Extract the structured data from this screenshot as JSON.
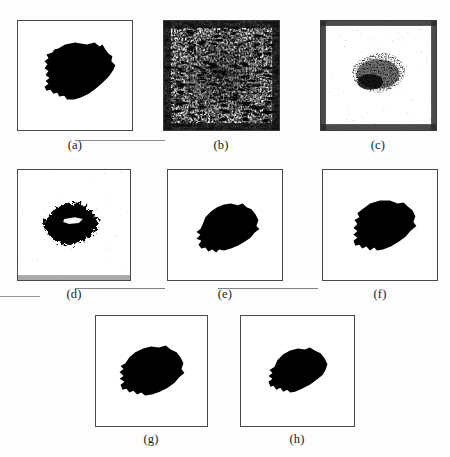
{
  "figure": {
    "page_background": "#fcfcfc",
    "panel_border_color": "#4a4a4a",
    "panel_fill_color": "#ffffff",
    "blob_color": "#000000",
    "panels": [
      {
        "id": "a",
        "caption": "(a)",
        "kind": "binary-silhouette",
        "description": "clean solid black irregular blob on white background",
        "x": 17,
        "y": 20,
        "w": 116,
        "h": 111,
        "caption_x": 55,
        "caption_y": 138,
        "caption_w": 40
      },
      {
        "id": "b",
        "caption": "(b)",
        "kind": "dense-noise",
        "description": "heavily speckled black and white noise texture filling the frame",
        "x": 163,
        "y": 20,
        "w": 117,
        "h": 111,
        "caption_x": 201,
        "caption_y": 138,
        "caption_w": 40
      },
      {
        "id": "c",
        "caption": "(c)",
        "kind": "sparse-noise-blob",
        "description": "dark noisy blob centered on a mostly white field with scattered speckles",
        "x": 320,
        "y": 20,
        "w": 117,
        "h": 111,
        "caption_x": 358,
        "caption_y": 138,
        "caption_w": 40
      },
      {
        "id": "d",
        "caption": "(d)",
        "kind": "rough-blob",
        "description": "black blob with ragged noisy border and small white holes inside",
        "x": 17,
        "y": 169,
        "w": 114,
        "h": 112,
        "caption_x": 54,
        "caption_y": 287,
        "caption_w": 40
      },
      {
        "id": "e",
        "caption": "(e)",
        "kind": "binary-silhouette",
        "description": "smooth solid black blob on white background",
        "x": 167,
        "y": 169,
        "w": 116,
        "h": 112,
        "caption_x": 205,
        "caption_y": 287,
        "caption_w": 40
      },
      {
        "id": "f",
        "caption": "(f)",
        "kind": "binary-silhouette",
        "description": "smooth solid black blob on white background",
        "x": 322,
        "y": 169,
        "w": 116,
        "h": 112,
        "caption_x": 360,
        "caption_y": 287,
        "caption_w": 40
      },
      {
        "id": "g",
        "caption": "(g)",
        "kind": "binary-silhouette",
        "description": "smooth solid black blob on white background",
        "x": 95,
        "y": 315,
        "w": 113,
        "h": 112,
        "caption_x": 131,
        "caption_y": 432,
        "caption_w": 40
      },
      {
        "id": "h",
        "caption": "(h)",
        "kind": "binary-silhouette",
        "description": "smooth solid black blob on white background",
        "x": 240,
        "y": 315,
        "w": 115,
        "h": 112,
        "caption_x": 277,
        "caption_y": 432,
        "caption_w": 40
      }
    ],
    "artifacts": [
      {
        "x": 75,
        "y": 140,
        "w": 90,
        "h": 1
      },
      {
        "x": 75,
        "y": 288,
        "w": 90,
        "h": 1
      },
      {
        "x": 218,
        "y": 288,
        "w": 100,
        "h": 1
      },
      {
        "x": 0,
        "y": 296,
        "w": 40,
        "h": 1
      }
    ]
  }
}
